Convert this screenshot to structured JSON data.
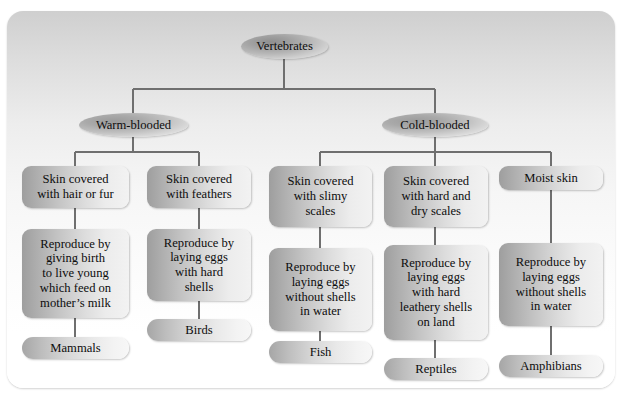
{
  "diagram": {
    "root": {
      "label": "Vertebrates"
    },
    "groups": [
      {
        "label": "Warm-blooded"
      },
      {
        "label": "Cold-blooded"
      }
    ],
    "branches": [
      {
        "group": "Warm-blooded",
        "skin": "Skin covered\nwith hair or fur",
        "reproduction": "Reproduce by\ngiving birth\nto live young\nwhich feed on\nmother’s milk",
        "animal": "Mammals"
      },
      {
        "group": "Warm-blooded",
        "skin": "Skin covered\nwith feathers",
        "reproduction": "Reproduce by\nlaying eggs\nwith hard\nshells",
        "animal": "Birds"
      },
      {
        "group": "Cold-blooded",
        "skin": "Skin covered\nwith slimy\nscales",
        "reproduction": "Reproduce by\nlaying eggs\nwithout shells\nin water",
        "animal": "Fish"
      },
      {
        "group": "Cold-blooded",
        "skin": "Skin covered\nwith hard and\ndry scales",
        "reproduction": "Reproduce by\nlaying eggs\nwith hard\nleathery shells\non land",
        "animal": "Reptiles"
      },
      {
        "group": "Cold-blooded",
        "skin": "Moist skin",
        "reproduction": "Reproduce by\nlaying eggs\nwithout shells\nin water",
        "animal": "Amphibians"
      }
    ],
    "colors": {
      "node_dark": "#9e9e9e",
      "node_light": "#f4f4f4",
      "connector": "#6f6f6f",
      "text": "#0d0d0d",
      "card_top": "#cfcfcf",
      "card_bottom": "#ffffff"
    }
  }
}
